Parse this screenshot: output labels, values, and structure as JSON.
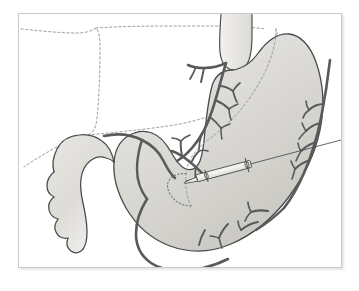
{
  "figure": {
    "domain": "medical-anatomical-illustration",
    "title": "",
    "caption": "",
    "background_color": "#ffffff",
    "frame": {
      "border_color": "#c9c9c9",
      "shadow_color": "rgba(0,0,0,0.10)",
      "x": 18,
      "y": 13,
      "width": 324,
      "height": 255
    },
    "palette": {
      "organ_fill_light": "#eceae6",
      "organ_fill_mid": "#d9d7d2",
      "organ_fill_dark": "#cac8c3",
      "organ_outline": "#4a4a4a",
      "vessel_color": "#5a5a5a",
      "dashed_outline_color": "#9a9a9a",
      "needle_outline": "#4a4a4a",
      "needle_fill": "#f2f1ef"
    },
    "structures": [
      {
        "id": "esophagus",
        "label": "Esophagus",
        "kind": "organ-tube",
        "visible": true
      },
      {
        "id": "stomach-body",
        "label": "Stomach (body and fundus)",
        "kind": "organ-body",
        "visible": true
      },
      {
        "id": "stomach-antrum",
        "label": "Gastric antrum",
        "kind": "organ-body",
        "visible": true
      },
      {
        "id": "pylorus",
        "label": "Pylorus",
        "kind": "organ-junction",
        "visible": true
      },
      {
        "id": "duodenum",
        "label": "Duodenum",
        "kind": "organ-tube",
        "visible": true
      },
      {
        "id": "lesser-curvature",
        "label": "Lesser curvature",
        "kind": "landmark",
        "visible": true
      },
      {
        "id": "greater-curvature",
        "label": "Greater curvature",
        "kind": "landmark",
        "visible": true
      },
      {
        "id": "liver-outline",
        "label": "Overlying organ outline (dashed)",
        "kind": "dashed-reference",
        "visible": true
      },
      {
        "id": "internal-dashed-outline",
        "label": "Internal reference outline (dashed)",
        "kind": "dashed-reference",
        "visible": true
      },
      {
        "id": "left-gastric-vessels",
        "label": "Left gastric vessel branches",
        "kind": "vasculature",
        "visible": true
      },
      {
        "id": "right-gastroepiploic-vessels",
        "label": "Gastroepiploic vessel branches",
        "kind": "vasculature",
        "visible": true
      },
      {
        "id": "short-gastric-vessels",
        "label": "Short gastric vessel branches",
        "kind": "vasculature",
        "visible": true
      },
      {
        "id": "injection-needle",
        "label": "Injection needle and syringe",
        "kind": "instrument",
        "visible": true
      },
      {
        "id": "injection-tract",
        "label": "Injection tract (dotted)",
        "kind": "dotted-path",
        "visible": true
      }
    ]
  }
}
